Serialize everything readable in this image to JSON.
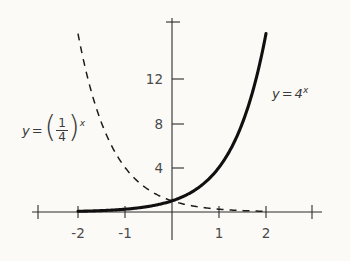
{
  "figure": {
    "kind": "cartesian-graph",
    "background_color": "#fbfaf7",
    "ink_color": "#101010"
  },
  "labels": {
    "solid_curve": {
      "y": "y",
      "equals": "=",
      "base": "4",
      "exponent": "x"
    },
    "dashed_curve": {
      "y": "y",
      "equals": "=",
      "numerator": "1",
      "denominator": "4",
      "exponent": "x",
      "paren_open": "(",
      "paren_close": ")"
    }
  },
  "chart_data": {
    "type": "line",
    "title": "",
    "xlabel": "",
    "ylabel": "",
    "xlim": [
      -2.85,
      2.98
    ],
    "ylim": [
      -1.2,
      17.0
    ],
    "grid": false,
    "legend": "inline-annotations",
    "x_ticks": [
      -2,
      -1,
      1,
      2
    ],
    "x_tick_labels": [
      "-2",
      "-1",
      "1",
      "2"
    ],
    "y_ticks": [
      4,
      8,
      12
    ],
    "y_tick_labels": [
      "4",
      "8",
      "12"
    ],
    "series": [
      {
        "name": "y = 4^x",
        "style": "solid",
        "linewidth": "thick",
        "x": [
          -2.0,
          -1.75,
          -1.5,
          -1.25,
          -1.0,
          -0.75,
          -0.5,
          -0.25,
          0.0,
          0.25,
          0.5,
          0.75,
          1.0,
          1.25,
          1.5,
          1.75,
          2.0
        ],
        "values": [
          0.0625,
          0.0884,
          0.125,
          0.1768,
          0.25,
          0.3536,
          0.5,
          0.7071,
          1.0,
          1.4142,
          2.0,
          2.8284,
          4.0,
          5.6569,
          8.0,
          11.3137,
          16.0
        ]
      },
      {
        "name": "y = (1/4)^x",
        "style": "dashed",
        "linewidth": "thin",
        "x": [
          -2.0,
          -1.75,
          -1.5,
          -1.25,
          -1.0,
          -0.75,
          -0.5,
          -0.25,
          0.0,
          0.25,
          0.5,
          0.75,
          1.0,
          1.25,
          1.5,
          1.75,
          2.0
        ],
        "values": [
          16.0,
          11.3137,
          8.0,
          5.6569,
          4.0,
          2.8284,
          2.0,
          1.4142,
          1.0,
          0.7071,
          0.5,
          0.3536,
          0.25,
          0.1768,
          0.125,
          0.0884,
          0.0625
        ]
      }
    ],
    "annotations": [
      {
        "text": "y = 4^x",
        "x": 2.2,
        "y": 13.0
      },
      {
        "text": "y = (1/4)^x",
        "x": -2.6,
        "y": 8.3
      }
    ]
  }
}
